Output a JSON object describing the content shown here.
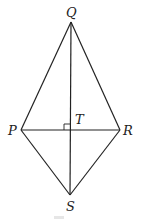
{
  "diagram": {
    "type": "kite-geometry",
    "points": {
      "Q": {
        "label": "Q",
        "x": 71,
        "y": 22
      },
      "P": {
        "label": "P",
        "x": 21,
        "y": 130
      },
      "R": {
        "label": "R",
        "x": 120,
        "y": 130
      },
      "S": {
        "label": "S",
        "x": 70,
        "y": 195
      },
      "T": {
        "label": "T",
        "x": 71,
        "y": 130
      }
    },
    "segments": [
      "QP",
      "QR",
      "PS",
      "RS",
      "QS",
      "PR"
    ],
    "right_angle_at": "T",
    "line_color": "#222222"
  }
}
